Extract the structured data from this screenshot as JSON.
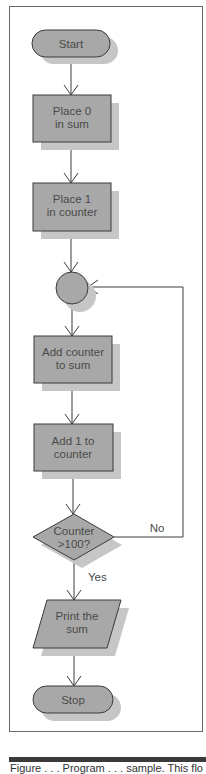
{
  "flowchart": {
    "colors": {
      "fill": "#a8a8a8",
      "shadow": "#c6c6c6",
      "stroke": "#3a3a3a",
      "text": "#4a4a4a"
    },
    "nodes": [
      {
        "id": "start",
        "shape": "terminator",
        "lines": [
          "Start"
        ]
      },
      {
        "id": "init-sum",
        "shape": "process",
        "lines": [
          "Place 0",
          "in sum"
        ]
      },
      {
        "id": "init-counter",
        "shape": "process",
        "lines": [
          "Place 1",
          "in counter"
        ]
      },
      {
        "id": "connector",
        "shape": "connector",
        "lines": []
      },
      {
        "id": "add-counter",
        "shape": "process",
        "lines": [
          "Add counter",
          "to sum"
        ]
      },
      {
        "id": "increment",
        "shape": "process",
        "lines": [
          "Add 1 to",
          "counter"
        ]
      },
      {
        "id": "decision",
        "shape": "decision",
        "lines": [
          "Counter",
          ">100?"
        ]
      },
      {
        "id": "print",
        "shape": "io",
        "lines": [
          "Print the",
          "sum"
        ]
      },
      {
        "id": "stop",
        "shape": "terminator",
        "lines": [
          "Stop"
        ]
      }
    ],
    "edge_labels": {
      "no": "No",
      "yes": "Yes"
    }
  },
  "caption": "Figure . . . Program . . . sample. This flo"
}
